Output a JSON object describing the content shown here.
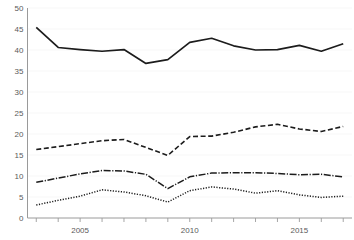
{
  "chart_data": {
    "type": "line",
    "title": "",
    "subtitle": "",
    "xlabel": "",
    "ylabel": "",
    "xlim": [
      2002.6,
      2017.4
    ],
    "ylim": [
      0,
      50
    ],
    "yticks": [
      0,
      5,
      10,
      15,
      20,
      25,
      30,
      35,
      40,
      45,
      50
    ],
    "ytick_labels": [
      "0",
      "5",
      "10",
      "15",
      "20",
      "25",
      "30",
      "35",
      "40",
      "45",
      "50"
    ],
    "xticks": [
      2003,
      2004,
      2005,
      2006,
      2007,
      2008,
      2009,
      2010,
      2011,
      2012,
      2013,
      2014,
      2015,
      2016,
      2017
    ],
    "xtick_labels": [
      "",
      "",
      "2005",
      "",
      "",
      "",
      "",
      "2010",
      "",
      "",
      "",
      "",
      "2015",
      "",
      ""
    ],
    "x": [
      2003,
      2004,
      2005,
      2006,
      2007,
      2008,
      2009,
      2010,
      2011,
      2012,
      2013,
      2014,
      2015,
      2016,
      2017
    ],
    "grid": true,
    "grid_axis": "y",
    "legend": "none",
    "series": [
      {
        "name": "series-1",
        "style": "solid",
        "color": "#1c1c1c",
        "values": [
          45.4,
          40.6,
          40.1,
          39.7,
          40.1,
          36.8,
          37.7,
          41.8,
          42.8,
          41.0,
          40.0,
          40.1,
          41.1,
          39.7,
          41.5
        ]
      },
      {
        "name": "series-2",
        "style": "dashed",
        "color": "#1c1c1c",
        "values": [
          16.3,
          17.0,
          17.7,
          18.4,
          18.7,
          16.8,
          14.9,
          19.4,
          19.5,
          20.4,
          21.7,
          22.3,
          21.2,
          20.6,
          21.8
        ]
      },
      {
        "name": "series-3",
        "style": "dash-dot",
        "color": "#1c1c1c",
        "values": [
          8.5,
          9.5,
          10.5,
          11.3,
          11.2,
          10.4,
          7.0,
          9.8,
          10.7,
          10.8,
          10.8,
          10.6,
          10.3,
          10.4,
          9.8
        ]
      },
      {
        "name": "series-4",
        "style": "dotted",
        "color": "#1c1c1c",
        "values": [
          3.1,
          4.2,
          5.2,
          6.7,
          6.2,
          5.3,
          3.8,
          6.5,
          7.4,
          6.9,
          5.9,
          6.5,
          5.5,
          4.9,
          5.2
        ]
      }
    ]
  }
}
